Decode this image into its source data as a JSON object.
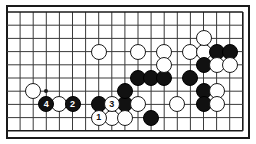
{
  "figure": {
    "kind": "go-board-diagram",
    "title": "",
    "board": {
      "origin_x": 7,
      "origin_y": 12,
      "step_x": 13.1,
      "step_y": 13.2,
      "cols": 18,
      "rows": 9,
      "line_color": "#3a3a3a",
      "border_color": "#1a1a1a",
      "background": "#ffffff"
    },
    "markers": {
      "hoshi": [
        {
          "col": 3,
          "row": 6
        }
      ]
    },
    "stones": [
      {
        "col": 2,
        "row": 6,
        "color": "white",
        "label": ""
      },
      {
        "col": 3,
        "row": 7,
        "color": "black",
        "label": "4"
      },
      {
        "col": 4,
        "row": 7,
        "color": "white",
        "label": ""
      },
      {
        "col": 5,
        "row": 7,
        "color": "black",
        "label": "2"
      },
      {
        "col": 7,
        "row": 7,
        "color": "black",
        "label": ""
      },
      {
        "col": 8,
        "row": 7,
        "color": "white",
        "label": "3"
      },
      {
        "col": 9,
        "row": 7,
        "color": "black",
        "label": ""
      },
      {
        "col": 10,
        "row": 7,
        "color": "white",
        "label": ""
      },
      {
        "col": 7,
        "row": 8,
        "color": "white",
        "label": "1"
      },
      {
        "col": 8,
        "row": 8,
        "color": "white",
        "label": ""
      },
      {
        "col": 9,
        "row": 8,
        "color": "white",
        "label": ""
      },
      {
        "col": 11,
        "row": 8,
        "color": "black",
        "label": ""
      },
      {
        "col": 9,
        "row": 6,
        "color": "black",
        "label": ""
      },
      {
        "col": 10,
        "row": 5,
        "color": "black",
        "label": ""
      },
      {
        "col": 11,
        "row": 5,
        "color": "black",
        "label": ""
      },
      {
        "col": 12,
        "row": 5,
        "color": "black",
        "label": ""
      },
      {
        "col": 14,
        "row": 5,
        "color": "black",
        "label": ""
      },
      {
        "col": 7,
        "row": 3,
        "color": "white",
        "label": ""
      },
      {
        "col": 10,
        "row": 3,
        "color": "white",
        "label": ""
      },
      {
        "col": 12,
        "row": 3,
        "color": "white",
        "label": ""
      },
      {
        "col": 14,
        "row": 3,
        "color": "white",
        "label": ""
      },
      {
        "col": 15,
        "row": 3,
        "color": "white",
        "label": ""
      },
      {
        "col": 16,
        "row": 3,
        "color": "black",
        "label": ""
      },
      {
        "col": 17,
        "row": 3,
        "color": "black",
        "label": ""
      },
      {
        "col": 15,
        "row": 2,
        "color": "white",
        "label": ""
      },
      {
        "col": 12,
        "row": 4,
        "color": "white",
        "label": ""
      },
      {
        "col": 15,
        "row": 4,
        "color": "black",
        "label": ""
      },
      {
        "col": 16,
        "row": 4,
        "color": "white",
        "label": ""
      },
      {
        "col": 17,
        "row": 4,
        "color": "white",
        "label": ""
      },
      {
        "col": 15,
        "row": 6,
        "color": "black",
        "label": ""
      },
      {
        "col": 16,
        "row": 6,
        "color": "white",
        "label": ""
      },
      {
        "col": 13,
        "row": 7,
        "color": "white",
        "label": ""
      },
      {
        "col": 15,
        "row": 7,
        "color": "black",
        "label": ""
      },
      {
        "col": 16,
        "row": 7,
        "color": "white",
        "label": ""
      }
    ]
  }
}
